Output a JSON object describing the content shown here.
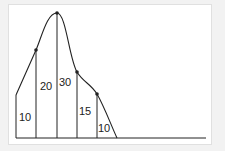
{
  "diagram": {
    "type": "histogram-like curve with vertical strips",
    "colors": {
      "line": "#222222",
      "background": "#f2f2f2",
      "panel": "#ffffff",
      "panel_border": "#e0e0e0"
    },
    "strip_labels": [
      "10",
      "20",
      "30",
      "15",
      "10"
    ],
    "points": [
      {
        "x": 16,
        "y": 95,
        "dot": false
      },
      {
        "x": 36,
        "y": 50,
        "dot": true
      },
      {
        "x": 57,
        "y": 13,
        "dot": true
      },
      {
        "x": 77,
        "y": 72,
        "dot": true
      },
      {
        "x": 97,
        "y": 94,
        "dot": true
      },
      {
        "x": 117,
        "y": 138,
        "dot": false
      }
    ]
  }
}
